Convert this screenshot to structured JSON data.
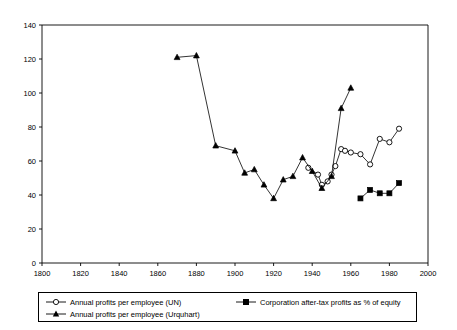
{
  "chart_data": {
    "type": "line",
    "title": "",
    "subtitle": "",
    "xlabel": "",
    "ylabel": "",
    "xlim": [
      1800,
      2000
    ],
    "ylim": [
      0,
      140
    ],
    "xticks": [
      1800,
      1820,
      1840,
      1860,
      1880,
      1900,
      1920,
      1940,
      1960,
      1980,
      2000
    ],
    "yticks": [
      0,
      20,
      40,
      60,
      80,
      100,
      120,
      140
    ],
    "grid": false,
    "legend_position": "below-plot",
    "series": [
      {
        "name": "Annual profits per employee (UN)",
        "marker": "open-circle",
        "color": "#000000",
        "x": [
          1938,
          1943,
          1945,
          1948,
          1950,
          1952,
          1955,
          1957,
          1960,
          1965,
          1970,
          1975,
          1980,
          1985
        ],
        "values": [
          56,
          52,
          46,
          48,
          52,
          57,
          67,
          66,
          65,
          64,
          58,
          73,
          71,
          79
        ]
      },
      {
        "name": "Corporation after-tax profits as % of equity",
        "marker": "filled-square",
        "color": "#000000",
        "x": [
          1965,
          1970,
          1975,
          1980,
          1985
        ],
        "values": [
          38,
          43,
          41,
          41,
          47
        ]
      },
      {
        "name": "Annual profits per employee (Urquhart)",
        "marker": "filled-triangle",
        "color": "#000000",
        "x": [
          1870,
          1880,
          1890,
          1900,
          1905,
          1910,
          1915,
          1920,
          1925,
          1930,
          1935,
          1940,
          1945,
          1950,
          1955,
          1960
        ],
        "values": [
          121,
          122,
          69,
          66,
          53,
          55,
          46,
          38,
          49,
          51,
          62,
          54,
          44,
          51,
          91,
          103
        ]
      }
    ]
  },
  "axes": {
    "x_tick_labels": [
      "1800",
      "1820",
      "1840",
      "1860",
      "1880",
      "1900",
      "1920",
      "1940",
      "1960",
      "1980",
      "2000"
    ],
    "y_tick_labels": [
      "0",
      "20",
      "40",
      "60",
      "80",
      "100",
      "120",
      "140"
    ]
  },
  "legend": {
    "entries": [
      {
        "label": "Annual profits per employee (UN)",
        "marker": "open-circle"
      },
      {
        "label": "Corporation after-tax profits as % of equity",
        "marker": "filled-square"
      },
      {
        "label": "Annual profits per employee (Urquhart)",
        "marker": "filled-triangle"
      }
    ]
  }
}
